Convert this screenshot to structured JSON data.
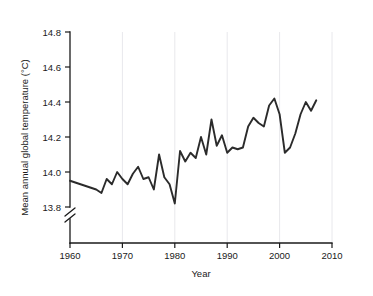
{
  "chart_data": {
    "type": "line",
    "title": "",
    "xlabel": "Year",
    "ylabel": "Mean annual global temperature (°C)",
    "xlim": [
      1960,
      2010
    ],
    "ylim": [
      13.8,
      14.8
    ],
    "xticks": [
      1960,
      1970,
      1980,
      1990,
      2000,
      2010
    ],
    "xtick_labels": [
      "1960",
      "1970",
      "1980",
      "1990",
      "2000",
      "2010"
    ],
    "yticks": [
      13.8,
      14.0,
      14.2,
      14.4,
      14.6,
      14.8
    ],
    "ytick_labels": [
      "13.8",
      "14.0",
      "14.2",
      "14.4",
      "14.6",
      "14.8"
    ],
    "grid": "vertical-only",
    "legend": "none",
    "y_axis_break": true,
    "y_axis_break_label": "axis-break-below-13.8",
    "line_color": "#2b2b2b",
    "gridline_color": "#e8e8ec",
    "x": [
      1960,
      1961,
      1962,
      1963,
      1964,
      1965,
      1966,
      1967,
      1968,
      1969,
      1970,
      1971,
      1972,
      1973,
      1974,
      1975,
      1976,
      1977,
      1978,
      1979,
      1980,
      1981,
      1982,
      1983,
      1984,
      1985,
      1986,
      1987,
      1988,
      1989,
      1990,
      1991,
      1992,
      1993,
      1994,
      1995,
      1996,
      1997,
      1998,
      1999,
      2000,
      2001,
      2002,
      2003,
      2004,
      2005,
      2006,
      2007
    ],
    "values": [
      13.95,
      13.94,
      13.93,
      13.92,
      13.91,
      13.9,
      13.88,
      13.96,
      13.93,
      14.0,
      13.96,
      13.93,
      13.99,
      14.03,
      13.96,
      13.97,
      13.9,
      14.1,
      13.97,
      13.93,
      13.82,
      14.12,
      14.06,
      14.11,
      14.08,
      14.2,
      14.1,
      14.3,
      14.15,
      14.21,
      14.11,
      14.14,
      14.13,
      14.14,
      14.26,
      14.31,
      14.28,
      14.26,
      14.38,
      14.42,
      14.33,
      14.11,
      14.14,
      14.22,
      14.33,
      14.4,
      14.35,
      14.41
    ]
  },
  "series_detail": {
    "name": "Mean annual global temperature",
    "unit": "°C",
    "point_count": 48,
    "min_value": 13.82,
    "min_year": 1980,
    "max_value": 14.62,
    "max_year": 2005
  },
  "axis_units": {
    "y_unit_symbol": "°C",
    "x_unit": "Year"
  }
}
